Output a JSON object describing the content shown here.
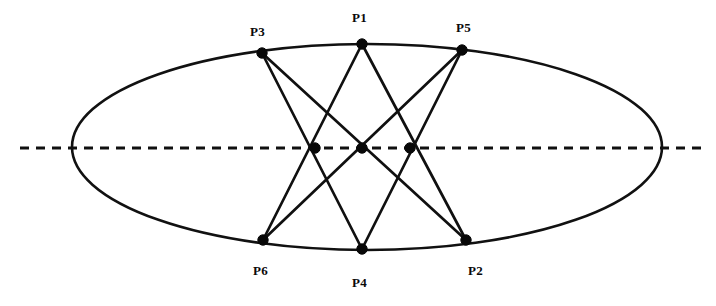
{
  "figure": {
    "background_color": "#ffffff",
    "ink_color": "#101010",
    "width": 716,
    "height": 306
  },
  "conic": {
    "name": "ellipse",
    "center_x": 367,
    "center_y": 147,
    "radius_x": 295,
    "radius_y": 103,
    "stroke_color": "#111111",
    "stroke_width": 2.6
  },
  "pascal_line": {
    "name": "pascal-line",
    "style": "dashed",
    "x1": 20,
    "y1": 148,
    "x2": 706,
    "y2": 148,
    "stroke_color": "#101010",
    "dash_pattern": "9 7"
  },
  "vertices": [
    {
      "id": "P1",
      "label": "P1",
      "x": 362,
      "y": 44,
      "label_x": 352,
      "label_y": 11,
      "on_conic": true
    },
    {
      "id": "P2",
      "label": "P2",
      "x": 466,
      "y": 240,
      "label_x": 468,
      "label_y": 264,
      "on_conic": true
    },
    {
      "id": "P3",
      "label": "P3",
      "x": 262,
      "y": 53,
      "label_x": 250,
      "label_y": 25,
      "on_conic": true
    },
    {
      "id": "P4",
      "label": "P4",
      "x": 362,
      "y": 249,
      "label_x": 352,
      "label_y": 276,
      "on_conic": true
    },
    {
      "id": "P5",
      "label": "P5",
      "x": 462,
      "y": 50,
      "label_x": 456,
      "label_y": 21,
      "on_conic": true
    },
    {
      "id": "P6",
      "label": "P6",
      "x": 263,
      "y": 240,
      "label_x": 253,
      "label_y": 264,
      "on_conic": true
    }
  ],
  "intersections": [
    {
      "id": "X1",
      "x": 315,
      "y": 148,
      "meets": "P1-P6 and P3-P4"
    },
    {
      "id": "X2",
      "x": 362,
      "y": 148,
      "meets": "P3-P2 and P5-P6"
    },
    {
      "id": "X3",
      "x": 410,
      "y": 148,
      "meets": "P1-P2 and P5-P4"
    }
  ],
  "chords": [
    {
      "id": "P3-P4",
      "from": "P3",
      "to": "P4",
      "x1": 262,
      "y1": 53,
      "x2": 362,
      "y2": 249
    },
    {
      "id": "P3-P2",
      "from": "P3",
      "to": "P2",
      "x1": 262,
      "y1": 53,
      "x2": 466,
      "y2": 240
    },
    {
      "id": "P1-P6",
      "from": "P1",
      "to": "P6",
      "x1": 362,
      "y1": 44,
      "x2": 263,
      "y2": 240
    },
    {
      "id": "P1-P2",
      "from": "P1",
      "to": "P2",
      "x1": 362,
      "y1": 44,
      "x2": 466,
      "y2": 240
    },
    {
      "id": "P5-P6",
      "from": "P5",
      "to": "P6",
      "x1": 462,
      "y1": 50,
      "x2": 263,
      "y2": 240
    },
    {
      "id": "P5-P4",
      "from": "P5",
      "to": "P4",
      "x1": 462,
      "y1": 50,
      "x2": 362,
      "y2": 249
    }
  ],
  "dot_radius": {
    "vertex": 5.2,
    "intersection": 5.2
  }
}
